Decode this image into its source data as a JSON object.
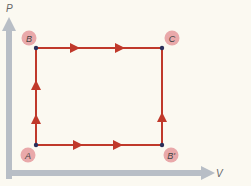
{
  "diagram": {
    "type": "pv-cycle",
    "axes": {
      "y_label": "P",
      "x_label": "V",
      "color": "#b8bec6"
    },
    "colors": {
      "path": "#c0392b",
      "point": "#2c2f5a",
      "label_circle": "#e9a9aa"
    },
    "points": [
      {
        "id": "A",
        "label": "A",
        "x": 36,
        "y": 145,
        "label_x": 28,
        "label_y": 155
      },
      {
        "id": "B",
        "label": "B",
        "x": 36,
        "y": 48,
        "label_x": 29,
        "label_y": 38
      },
      {
        "id": "C",
        "label": "C",
        "x": 162,
        "y": 48,
        "label_x": 172,
        "label_y": 38
      },
      {
        "id": "Bprime",
        "label": "B'",
        "x": 162,
        "y": 145,
        "label_x": 171,
        "label_y": 155
      }
    ],
    "paths": [
      {
        "from": "A",
        "to": "B",
        "direction": "up",
        "arrows": 2
      },
      {
        "from": "B",
        "to": "C",
        "direction": "right",
        "arrows": 2
      },
      {
        "from": "A",
        "to": "Bprime",
        "direction": "right",
        "arrows": 2
      },
      {
        "from": "Bprime",
        "to": "C",
        "direction": "up",
        "arrows": 1
      }
    ]
  }
}
